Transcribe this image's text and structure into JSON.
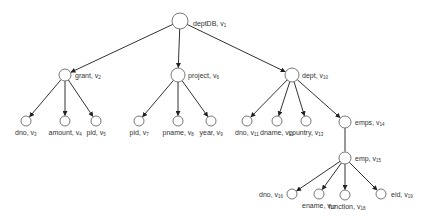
{
  "diagram": {
    "type": "tree",
    "colors": {
      "edge": "#333333",
      "node_stroke": "#555555",
      "node_fill": "#ffffff",
      "text": "#333333"
    },
    "nodes": [
      {
        "id": "v1",
        "name": "deptDB",
        "sub": "1",
        "x": 180,
        "y": 21,
        "r": 8,
        "lx": 193,
        "ly": 20,
        "anchor": "left"
      },
      {
        "id": "v2",
        "name": "grant",
        "sub": "2",
        "x": 65,
        "y": 75,
        "r": 6,
        "lx": 75,
        "ly": 72,
        "anchor": "left"
      },
      {
        "id": "v3",
        "name": "dno",
        "sub": "3",
        "x": 26,
        "y": 121,
        "r": 5,
        "lx": 26,
        "ly": 129,
        "anchor": "center"
      },
      {
        "id": "v4",
        "name": "amount",
        "sub": "4",
        "x": 65,
        "y": 121,
        "r": 5,
        "lx": 65,
        "ly": 129,
        "anchor": "center"
      },
      {
        "id": "v5",
        "name": "pid",
        "sub": "5",
        "x": 96,
        "y": 121,
        "r": 5,
        "lx": 96,
        "ly": 129,
        "anchor": "center"
      },
      {
        "id": "v6",
        "name": "project",
        "sub": "6",
        "x": 178,
        "y": 75,
        "r": 7,
        "lx": 188,
        "ly": 72,
        "anchor": "left"
      },
      {
        "id": "v7",
        "name": "pid",
        "sub": "7",
        "x": 139,
        "y": 121,
        "r": 5,
        "lx": 139,
        "ly": 129,
        "anchor": "center"
      },
      {
        "id": "v8",
        "name": "pname",
        "sub": "8",
        "x": 178,
        "y": 121,
        "r": 5,
        "lx": 178,
        "ly": 129,
        "anchor": "center"
      },
      {
        "id": "v9",
        "name": "year",
        "sub": "9",
        "x": 211,
        "y": 121,
        "r": 5,
        "lx": 211,
        "ly": 129,
        "anchor": "center"
      },
      {
        "id": "v10",
        "name": "dept",
        "sub": "10",
        "x": 292,
        "y": 75,
        "r": 7,
        "lx": 302,
        "ly": 72,
        "anchor": "left"
      },
      {
        "id": "v11",
        "name": "dno",
        "sub": "11",
        "x": 247,
        "y": 121,
        "r": 5,
        "lx": 247,
        "ly": 129,
        "anchor": "center"
      },
      {
        "id": "v12",
        "name": "dname",
        "sub": "12",
        "x": 277,
        "y": 121,
        "r": 5,
        "lx": 277,
        "ly": 129,
        "anchor": "center"
      },
      {
        "id": "v13",
        "name": "country",
        "sub": "13",
        "x": 306,
        "y": 121,
        "r": 5,
        "lx": 306,
        "ly": 129,
        "anchor": "center"
      },
      {
        "id": "v14",
        "name": "emps",
        "sub": "14",
        "x": 345,
        "y": 122,
        "r": 6,
        "lx": 355,
        "ly": 119,
        "anchor": "left"
      },
      {
        "id": "v15",
        "name": "emp",
        "sub": "15",
        "x": 345,
        "y": 158,
        "r": 6,
        "lx": 355,
        "ly": 155,
        "anchor": "left"
      },
      {
        "id": "v16",
        "name": "dno",
        "sub": "16",
        "x": 292,
        "y": 194,
        "r": 5,
        "lx": 283,
        "ly": 191,
        "anchor": "right"
      },
      {
        "id": "v17",
        "name": "ename",
        "sub": "17",
        "x": 319,
        "y": 194,
        "r": 5,
        "lx": 319,
        "ly": 202,
        "anchor": "center"
      },
      {
        "id": "v18",
        "name": "function",
        "sub": "18",
        "x": 345,
        "y": 195,
        "r": 5,
        "lx": 347,
        "ly": 203,
        "anchor": "center"
      },
      {
        "id": "v19",
        "name": "eid",
        "sub": "19",
        "x": 381,
        "y": 194,
        "r": 5,
        "lx": 391,
        "ly": 191,
        "anchor": "left"
      }
    ],
    "edges": [
      [
        "v1",
        "v2"
      ],
      [
        "v1",
        "v6"
      ],
      [
        "v1",
        "v10"
      ],
      [
        "v2",
        "v3"
      ],
      [
        "v2",
        "v4"
      ],
      [
        "v2",
        "v5"
      ],
      [
        "v6",
        "v7"
      ],
      [
        "v6",
        "v8"
      ],
      [
        "v6",
        "v9"
      ],
      [
        "v10",
        "v11"
      ],
      [
        "v10",
        "v12"
      ],
      [
        "v10",
        "v13"
      ],
      [
        "v10",
        "v14"
      ],
      [
        "v14",
        "v15"
      ],
      [
        "v15",
        "v16"
      ],
      [
        "v15",
        "v17"
      ],
      [
        "v15",
        "v18"
      ],
      [
        "v15",
        "v19"
      ]
    ],
    "arrowless_edges": [
      [
        "v14",
        "v15"
      ]
    ]
  }
}
